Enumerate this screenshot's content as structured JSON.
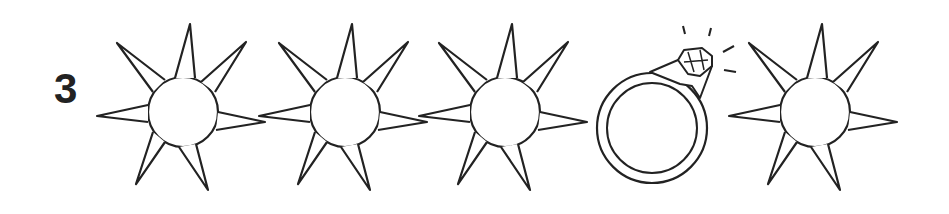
{
  "puzzle": {
    "number": "3",
    "sequence": [
      {
        "icon": "sun-icon",
        "cx": 183,
        "cy": 112
      },
      {
        "icon": "sun-icon",
        "cx": 345,
        "cy": 112
      },
      {
        "icon": "sun-icon",
        "cx": 505,
        "cy": 112
      },
      {
        "icon": "diamond-ring-icon",
        "cx": 660,
        "cy": 128
      },
      {
        "icon": "sun-icon",
        "cx": 815,
        "cy": 112
      }
    ]
  },
  "colors": {
    "ink": "#222222",
    "background": "#ffffff"
  }
}
